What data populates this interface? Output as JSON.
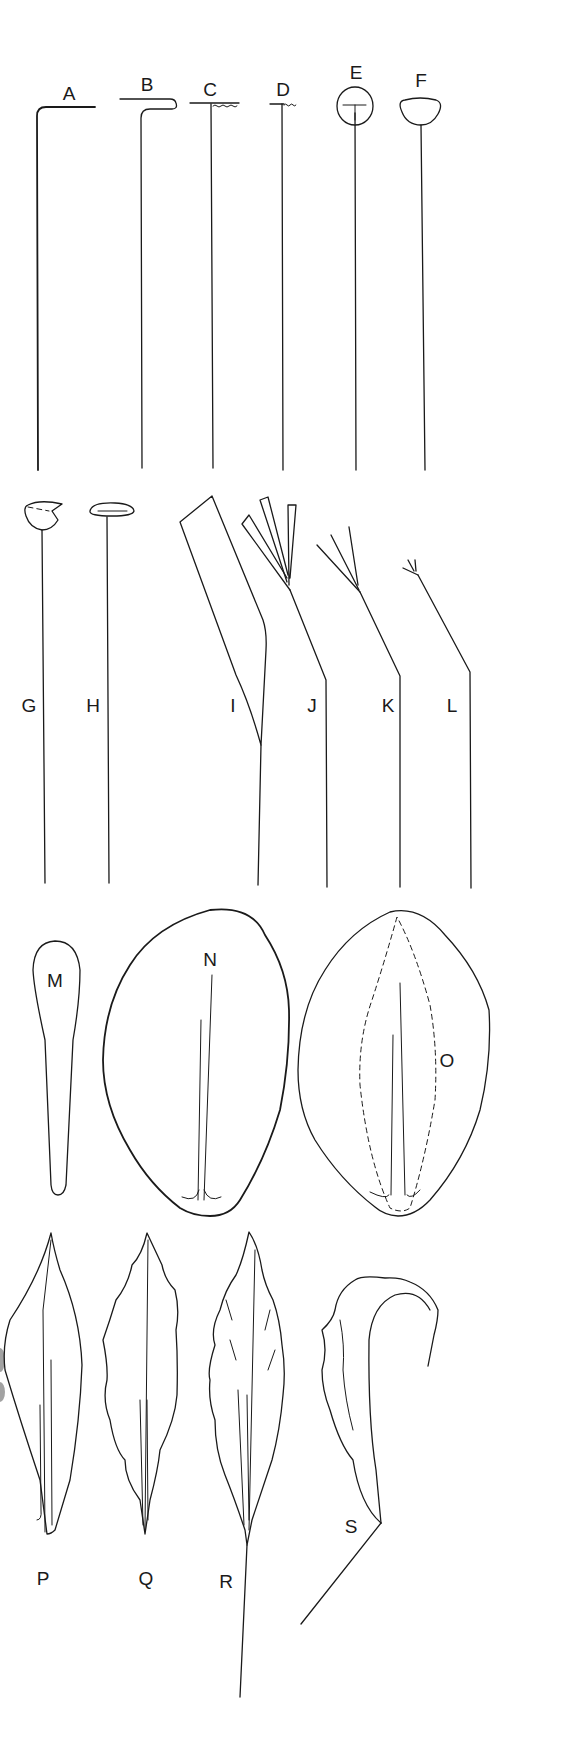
{
  "figure": {
    "type": "labeled line-art illustration",
    "labels": {
      "A": "A",
      "B": "B",
      "C": "C",
      "D": "D",
      "E": "E",
      "F": "F",
      "G": "G",
      "H": "H",
      "I": "I",
      "J": "J",
      "K": "K",
      "L": "L",
      "M": "M",
      "N": "N",
      "O": "O",
      "P": "P",
      "Q": "Q",
      "R": "R",
      "S": "S"
    },
    "rows": [
      {
        "row": 1,
        "items": [
          "A",
          "B",
          "C",
          "D",
          "E",
          "F"
        ],
        "description": "straight stalks with various terminal heads"
      },
      {
        "row": 2,
        "items": [
          "G",
          "H",
          "I",
          "J",
          "K",
          "L"
        ],
        "description": "stalks with cup/disc heads and bent stalks with flag/branched tips"
      },
      {
        "row": 3,
        "items": [
          "M",
          "N",
          "O"
        ],
        "description": "spatulate and ovate flat outlines with midlines"
      },
      {
        "row": 4,
        "items": [
          "P",
          "Q",
          "R",
          "S"
        ],
        "description": "lanceolate outlines, wavy margins, curled form"
      }
    ],
    "colors": {
      "ink": "#1a1a1a",
      "background": "#ffffff"
    }
  }
}
